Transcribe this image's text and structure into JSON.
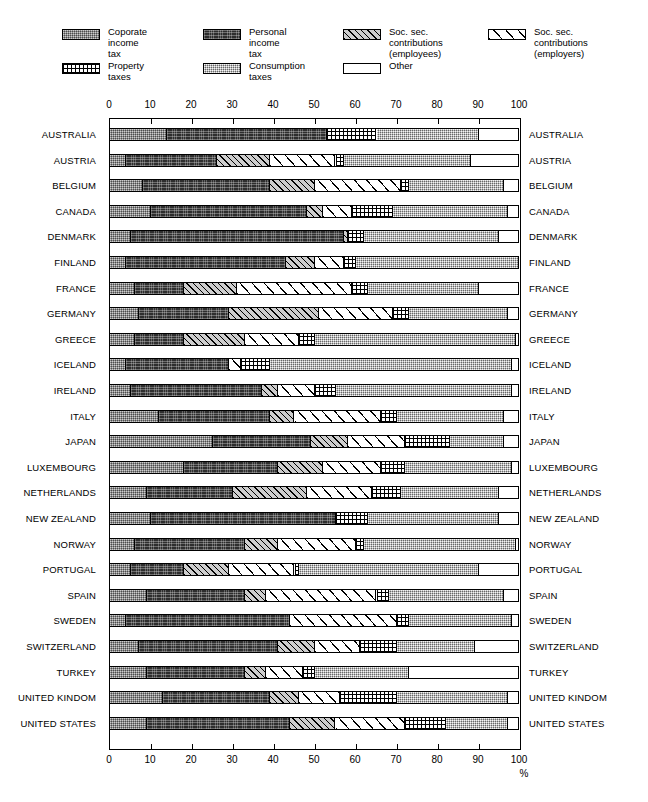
{
  "legend": {
    "items": [
      {
        "key": "corporate",
        "label": "Coporate income tax",
        "pattern": "gray-stipple"
      },
      {
        "key": "personal",
        "label": "Personal income tax",
        "pattern": "dark-stipple"
      },
      {
        "key": "ss_employees",
        "label": "Soc. sec. contributions\n(employees)",
        "pattern": "dense-hatch-gray"
      },
      {
        "key": "ss_employers",
        "label": "Soc. sec. contributions\n(employers)",
        "pattern": "wide-hatch-white"
      },
      {
        "key": "property",
        "label": "Property taxes",
        "pattern": "grid"
      },
      {
        "key": "consumption",
        "label": "Consumption taxes",
        "pattern": "light-stipple"
      },
      {
        "key": "other",
        "label": "Other",
        "pattern": "white"
      }
    ]
  },
  "axis": {
    "ticks": [
      "0",
      "10",
      "20",
      "30",
      "40",
      "50",
      "60",
      "70",
      "80",
      "90",
      "100"
    ],
    "unit_label": "%",
    "min": 0,
    "max": 100
  },
  "chart_data": {
    "type": "bar",
    "orientation": "horizontal",
    "stacked": true,
    "title": "",
    "xlabel": "%",
    "ylabel": "",
    "xlim": [
      0,
      100
    ],
    "grid": false,
    "legend_position": "top",
    "series": [
      {
        "name": "Coporate income tax",
        "key": "corporate"
      },
      {
        "name": "Personal income tax",
        "key": "personal"
      },
      {
        "name": "Soc. sec. contributions (employees)",
        "key": "ss_employees"
      },
      {
        "name": "Soc. sec. contributions (employers)",
        "key": "ss_employers"
      },
      {
        "name": "Property taxes",
        "key": "property"
      },
      {
        "name": "Consumption taxes",
        "key": "consumption"
      },
      {
        "name": "Other",
        "key": "other"
      }
    ],
    "categories": [
      "AUSTRALIA",
      "AUSTRIA",
      "BELGIUM",
      "CANADA",
      "DENMARK",
      "FINLAND",
      "FRANCE",
      "GERMANY",
      "GREECE",
      "ICELAND",
      "IRELAND",
      "ITALY",
      "JAPAN",
      "LUXEMBOURG",
      "NETHERLANDS",
      "NEW ZEALAND",
      "NORWAY",
      "PORTUGAL",
      "SPAIN",
      "SWEDEN",
      "SWITZERLAND",
      "TURKEY",
      "UNITED KINDOM",
      "UNITED STATES"
    ],
    "rows": [
      {
        "country": "AUSTRALIA",
        "corporate": 14,
        "personal": 39,
        "ss_employees": 0,
        "ss_employers": 0,
        "property": 12,
        "consumption": 25,
        "other": 10
      },
      {
        "country": "AUSTRIA",
        "corporate": 4,
        "personal": 22,
        "ss_employees": 13,
        "ss_employers": 16,
        "property": 2,
        "consumption": 31,
        "other": 12
      },
      {
        "country": "BELGIUM",
        "corporate": 8,
        "personal": 31,
        "ss_employees": 11,
        "ss_employers": 21,
        "property": 2,
        "consumption": 23,
        "other": 4
      },
      {
        "country": "CANADA",
        "corporate": 10,
        "personal": 38,
        "ss_employees": 4,
        "ss_employers": 7,
        "property": 10,
        "consumption": 28,
        "other": 3
      },
      {
        "country": "DENMARK",
        "corporate": 5,
        "personal": 52,
        "ss_employees": 1,
        "ss_employers": 0,
        "property": 4,
        "consumption": 33,
        "other": 5
      },
      {
        "country": "FINLAND",
        "corporate": 4,
        "personal": 39,
        "ss_employees": 7,
        "ss_employers": 7,
        "property": 3,
        "consumption": 40,
        "other": 0
      },
      {
        "country": "FRANCE",
        "corporate": 6,
        "personal": 12,
        "ss_employees": 13,
        "ss_employers": 28,
        "property": 4,
        "consumption": 27,
        "other": 10
      },
      {
        "country": "GERMANY",
        "corporate": 7,
        "personal": 22,
        "ss_employees": 22,
        "ss_employers": 18,
        "property": 4,
        "consumption": 24,
        "other": 3
      },
      {
        "country": "GREECE",
        "corporate": 6,
        "personal": 12,
        "ss_employees": 15,
        "ss_employers": 13,
        "property": 4,
        "consumption": 49,
        "other": 1
      },
      {
        "country": "ICELAND",
        "corporate": 4,
        "personal": 25,
        "ss_employees": 0,
        "ss_employers": 3,
        "property": 7,
        "consumption": 59,
        "other": 2
      },
      {
        "country": "IRELAND",
        "corporate": 5,
        "personal": 32,
        "ss_employees": 4,
        "ss_employers": 9,
        "property": 5,
        "consumption": 43,
        "other": 2
      },
      {
        "country": "ITALY",
        "corporate": 12,
        "personal": 27,
        "ss_employees": 6,
        "ss_employers": 21,
        "property": 4,
        "consumption": 26,
        "other": 4
      },
      {
        "country": "JAPAN",
        "corporate": 25,
        "personal": 24,
        "ss_employees": 9,
        "ss_employers": 14,
        "property": 11,
        "consumption": 13,
        "other": 4
      },
      {
        "country": "LUXEMBOURG",
        "corporate": 18,
        "personal": 23,
        "ss_employees": 11,
        "ss_employers": 14,
        "property": 6,
        "consumption": 26,
        "other": 2
      },
      {
        "country": "NETHERLANDS",
        "corporate": 9,
        "personal": 21,
        "ss_employees": 18,
        "ss_employers": 16,
        "property": 7,
        "consumption": 24,
        "other": 5
      },
      {
        "country": "NEW ZEALAND",
        "corporate": 10,
        "personal": 45,
        "ss_employees": 0,
        "ss_employers": 0,
        "property": 8,
        "consumption": 32,
        "other": 5
      },
      {
        "country": "NORWAY",
        "corporate": 6,
        "personal": 27,
        "ss_employees": 8,
        "ss_employers": 19,
        "property": 2,
        "consumption": 37,
        "other": 1
      },
      {
        "country": "PORTUGAL",
        "corporate": 5,
        "personal": 13,
        "ss_employees": 11,
        "ss_employers": 16,
        "property": 1,
        "consumption": 44,
        "other": 10
      },
      {
        "country": "SPAIN",
        "corporate": 9,
        "personal": 24,
        "ss_employees": 5,
        "ss_employers": 27,
        "property": 3,
        "consumption": 28,
        "other": 4
      },
      {
        "country": "SWEDEN",
        "corporate": 4,
        "personal": 40,
        "ss_employees": 0,
        "ss_employers": 26,
        "property": 3,
        "consumption": 25,
        "other": 2
      },
      {
        "country": "SWITZERLAND",
        "corporate": 7,
        "personal": 34,
        "ss_employees": 9,
        "ss_employers": 11,
        "property": 9,
        "consumption": 19,
        "other": 11
      },
      {
        "country": "TURKEY",
        "corporate": 9,
        "personal": 24,
        "ss_employees": 5,
        "ss_employers": 9,
        "property": 3,
        "consumption": 23,
        "other": 27
      },
      {
        "country": "UNITED KINDOM",
        "corporate": 13,
        "personal": 26,
        "ss_employees": 7,
        "ss_employers": 10,
        "property": 14,
        "consumption": 27,
        "other": 3
      },
      {
        "country": "UNITED STATES",
        "corporate": 9,
        "personal": 35,
        "ss_employees": 11,
        "ss_employers": 17,
        "property": 10,
        "consumption": 15,
        "other": 3
      }
    ]
  }
}
